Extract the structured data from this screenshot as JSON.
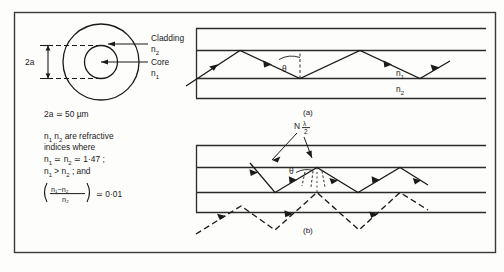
{
  "figure": {
    "left_panel": {
      "cross_section": {
        "dimension_label": "2a",
        "cladding_label": "Cladding",
        "cladding_index": "n",
        "cladding_index_sub": "2",
        "core_label": "Core",
        "core_index": "n",
        "core_index_sub": "1"
      },
      "notes": {
        "line1": {
          "prefix": "2a ",
          "approx": "≃",
          "value": " 50 µm"
        },
        "line2_parts": [
          "n",
          "1",
          "  n",
          "2",
          " are refractive"
        ],
        "line3": "indices where",
        "line4_parts": [
          "n",
          "1",
          " ≃ n",
          "2",
          " ≃ 1·47 ;"
        ],
        "line5_parts": [
          "n",
          "1",
          " > n",
          "2",
          " ; and"
        ],
        "fraction": {
          "numerator": "n₁−n₂",
          "denominator": "n₂",
          "relation": "≃ 0·01"
        }
      }
    },
    "panel_a": {
      "caption": "(a)",
      "angle_label": "θ",
      "index_core": "n",
      "index_core_sub": "1",
      "index_clad": "n",
      "index_clad_sub": "2"
    },
    "panel_b": {
      "caption": "(b)",
      "angle_label": "θ",
      "wavefront_label_N": "N",
      "wavefront_lambda": "λ",
      "wavefront_denom": "2"
    }
  },
  "colors": {
    "ink": "#1a1a1a",
    "line": "#2b2b2b",
    "frame": "#3a3a3a",
    "paper": "#fdfdfc"
  }
}
